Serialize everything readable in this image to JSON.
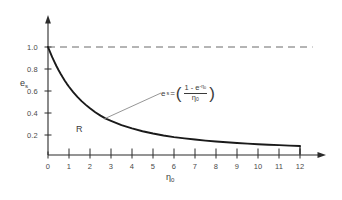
{
  "chart_data": {
    "type": "line",
    "title": "",
    "xlabel": "η₀",
    "ylabel": "eₛ",
    "xlim": [
      0,
      12
    ],
    "ylim": [
      0,
      1.06
    ],
    "grid": false,
    "legend": "none",
    "x_ticks": [
      "0",
      "1",
      "2",
      "3",
      "4",
      "5",
      "6",
      "7",
      "8",
      "9",
      "10",
      "11",
      "12"
    ],
    "x_tick_values": [
      0,
      1,
      2,
      3,
      4,
      5,
      6,
      7,
      8,
      9,
      10,
      11,
      12
    ],
    "y_ticks": [
      "0.2",
      "0.4",
      "0.6",
      "0.8",
      "1.0"
    ],
    "y_tick_values": [
      0.2,
      0.4,
      0.6,
      0.8,
      1.0
    ],
    "series": [
      {
        "name": "e_s",
        "style": "solid",
        "color": "#1a1a1a",
        "x": [
          0.0,
          0.1,
          0.2,
          0.3,
          0.4,
          0.5,
          0.6,
          0.7,
          0.8,
          0.9,
          1.0,
          1.2,
          1.4,
          1.6,
          1.8,
          2.0,
          2.25,
          2.5,
          2.75,
          3.0,
          3.5,
          4.0,
          4.5,
          5.0,
          5.5,
          6.0,
          6.5,
          7.0,
          7.5,
          8.0,
          8.5,
          9.0,
          9.5,
          10.0,
          10.5,
          11.0,
          11.5,
          12.0
        ],
        "y": [
          1.0,
          0.952,
          0.906,
          0.864,
          0.824,
          0.787,
          0.752,
          0.719,
          0.688,
          0.659,
          0.632,
          0.582,
          0.538,
          0.499,
          0.464,
          0.432,
          0.396,
          0.365,
          0.337,
          0.317,
          0.277,
          0.246,
          0.22,
          0.199,
          0.181,
          0.166,
          0.154,
          0.143,
          0.133,
          0.125,
          0.118,
          0.111,
          0.105,
          0.1,
          0.095,
          0.091,
          0.087,
          0.083
        ]
      },
      {
        "name": "asymptote",
        "style": "dashed",
        "color": "#6b6b6b",
        "x": [
          0,
          12.6
        ],
        "y": [
          1.0,
          1.0
        ]
      }
    ],
    "annotations": [
      {
        "name": "region-label",
        "text": "R",
        "x": 1.35,
        "y": 0.22
      },
      {
        "name": "equation-label",
        "text": "eₛ = ( (1 - e^(-η₀)) / η₀ )",
        "x": 5.5,
        "y": 0.62
      }
    ]
  },
  "axes": {
    "y_label": "e",
    "y_label_sub": "s",
    "x_label": "η",
    "x_label_sub": "0"
  },
  "region": {
    "label": "R"
  },
  "equation": {
    "lhs": "e",
    "lhs_sub": "s",
    "equals": "=",
    "open_paren": "(",
    "close_paren": ")",
    "numerator_pre": "1 - e",
    "numerator_exp": "-η",
    "numerator_exp_sub": "0",
    "denominator": "η",
    "denominator_sub": "0"
  },
  "ticks": {
    "x": [
      "0",
      "1",
      "2",
      "3",
      "4",
      "5",
      "6",
      "7",
      "8",
      "9",
      "10",
      "11",
      "12"
    ],
    "y": [
      "0.2",
      "0.4",
      "0.6",
      "0.8",
      "1.0"
    ]
  },
  "colors": {
    "curve": "#1a1a1a",
    "axis": "#2b2b2b",
    "dashed": "#6b6b6b",
    "text": "#3a3a3a",
    "background": "#ffffff"
  }
}
